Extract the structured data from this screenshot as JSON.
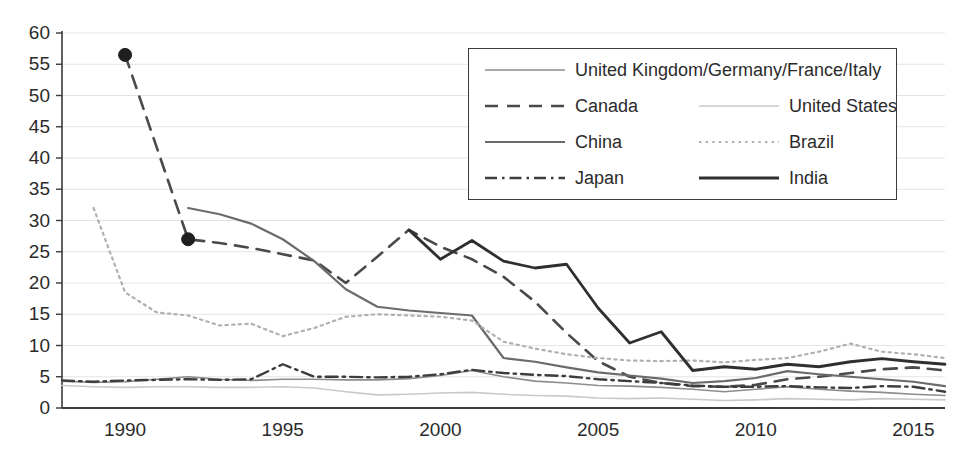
{
  "chart_data": {
    "type": "line",
    "title": "",
    "xlabel": "",
    "ylabel": "",
    "xlim": [
      1988,
      2016
    ],
    "ylim": [
      0,
      60
    ],
    "ytick_step": 5,
    "grid": "horizontal",
    "legend_position": "top-right",
    "xticks": [
      "1990",
      "1995",
      "2000",
      "2005",
      "2010",
      "2015"
    ],
    "xtick_values": [
      1990,
      1995,
      2000,
      2005,
      2010,
      2015
    ],
    "yticks": [
      "0",
      "5",
      "10",
      "15",
      "20",
      "25",
      "30",
      "35",
      "40",
      "45",
      "50",
      "55",
      "60"
    ],
    "ytick_values": [
      0,
      5,
      10,
      15,
      20,
      25,
      30,
      35,
      40,
      45,
      50,
      55,
      60
    ],
    "series": [
      {
        "name": "United Kingdom/Germany/France/Italy",
        "style": "solid-thin",
        "color": "#8c8c8c",
        "width": 1.6,
        "markers": false,
        "x": [
          1988,
          1989,
          1990,
          1991,
          1992,
          1993,
          1994,
          1995,
          1996,
          1997,
          1998,
          1999,
          2000,
          2001,
          2002,
          2003,
          2004,
          2005,
          2006,
          2007,
          2008,
          2009,
          2010,
          2011,
          2012,
          2013,
          2014,
          2015,
          2016
        ],
        "values": [
          4.3,
          4.1,
          4.2,
          4.6,
          5.0,
          4.6,
          4.4,
          4.6,
          4.6,
          4.5,
          4.5,
          4.7,
          5.2,
          6.0,
          5.0,
          4.3,
          4.0,
          3.6,
          3.5,
          3.3,
          3.0,
          2.6,
          3.0,
          3.4,
          3.0,
          2.7,
          2.5,
          2.2,
          2.0
        ]
      },
      {
        "name": "Canada",
        "style": "dashed",
        "color": "#4a4a4a",
        "width": 2.6,
        "markers": true,
        "marker_x": [
          1990,
          1992
        ],
        "marker_values": [
          56.5,
          27.0
        ],
        "x": [
          1990,
          1992,
          1993,
          1994,
          1995,
          1996,
          1997,
          1998,
          1999,
          2000,
          2001,
          2002,
          2003,
          2004,
          2005,
          2006,
          2007,
          2008,
          2009,
          2010,
          2011,
          2012,
          2013,
          2014,
          2015,
          2016
        ],
        "values": [
          56.5,
          27.0,
          26.4,
          25.6,
          24.6,
          23.6,
          20.0,
          24.2,
          28.5,
          25.8,
          23.8,
          21.0,
          17.0,
          12.0,
          7.5,
          5.0,
          4.0,
          3.5,
          3.4,
          3.7,
          4.6,
          5.0,
          5.6,
          6.2,
          6.5,
          6.0
        ]
      },
      {
        "name": "United States",
        "style": "solid-faint",
        "color": "#c9c9c9",
        "width": 1.6,
        "markers": false,
        "x": [
          1988,
          1989,
          1990,
          1991,
          1992,
          1993,
          1994,
          1995,
          1996,
          1997,
          1998,
          1999,
          2000,
          2001,
          2002,
          2003,
          2004,
          2005,
          2006,
          2007,
          2008,
          2009,
          2010,
          2011,
          2012,
          2013,
          2014,
          2015,
          2016
        ],
        "values": [
          3.6,
          3.4,
          3.3,
          3.4,
          3.4,
          3.3,
          3.3,
          3.4,
          3.2,
          2.6,
          2.1,
          2.2,
          2.4,
          2.5,
          2.2,
          2.0,
          1.9,
          1.6,
          1.5,
          1.6,
          1.4,
          1.2,
          1.3,
          1.5,
          1.4,
          1.3,
          1.5,
          1.4,
          1.3
        ]
      },
      {
        "name": "China",
        "style": "solid-medium",
        "color": "#6b6b6b",
        "width": 2.2,
        "markers": false,
        "x": [
          1992,
          1993,
          1994,
          1995,
          1996,
          1997,
          1998,
          1999,
          2000,
          2001,
          2002,
          2003,
          2004,
          2005,
          2006,
          2007,
          2008,
          2009,
          2010,
          2011,
          2012,
          2013,
          2014,
          2015,
          2016
        ],
        "values": [
          32.0,
          31.0,
          29.5,
          27.0,
          23.5,
          19.0,
          16.2,
          15.6,
          15.2,
          14.8,
          8.0,
          7.4,
          6.5,
          5.7,
          5.2,
          4.7,
          4.0,
          4.3,
          4.8,
          5.9,
          5.4,
          5.0,
          4.6,
          4.2,
          3.5
        ]
      },
      {
        "name": "Brazil",
        "style": "dotted",
        "color": "#b0b0b0",
        "width": 2.2,
        "markers": false,
        "x": [
          1989,
          1990,
          1991,
          1992,
          1993,
          1994,
          1995,
          1996,
          1997,
          1998,
          1999,
          2000,
          2001,
          2002,
          2003,
          2004,
          2005,
          2006,
          2007,
          2008,
          2009,
          2010,
          2011,
          2012,
          2013,
          2014,
          2015,
          2016
        ],
        "values": [
          32.0,
          18.5,
          15.3,
          14.8,
          13.2,
          13.5,
          11.5,
          12.8,
          14.6,
          15.0,
          14.8,
          14.6,
          14.0,
          10.6,
          9.5,
          8.6,
          8.0,
          7.6,
          7.5,
          7.6,
          7.3,
          7.7,
          8.0,
          9.0,
          10.3,
          9.0,
          8.6,
          8.0
        ]
      },
      {
        "name": "Japan",
        "style": "dash-dot",
        "color": "#3d3d3d",
        "width": 2.4,
        "markers": false,
        "x": [
          1988,
          1989,
          1990,
          1991,
          1992,
          1993,
          1994,
          1995,
          1996,
          1997,
          1998,
          1999,
          2000,
          2001,
          2002,
          2003,
          2004,
          2005,
          2006,
          2007,
          2008,
          2009,
          2010,
          2011,
          2012,
          2013,
          2014,
          2015,
          2016
        ],
        "values": [
          4.4,
          4.2,
          4.4,
          4.5,
          4.6,
          4.5,
          4.6,
          7.0,
          5.0,
          5.0,
          4.9,
          5.0,
          5.4,
          6.1,
          5.6,
          5.3,
          5.1,
          4.6,
          4.3,
          4.0,
          3.6,
          3.4,
          3.4,
          3.5,
          3.3,
          3.2,
          3.5,
          3.4,
          2.6
        ]
      },
      {
        "name": "India",
        "style": "solid-thick",
        "color": "#2f2f2f",
        "width": 2.8,
        "markers": false,
        "x": [
          1999,
          2000,
          2001,
          2002,
          2003,
          2004,
          2005,
          2006,
          2007,
          2008,
          2009,
          2010,
          2011,
          2012,
          2013,
          2014,
          2015,
          2016
        ],
        "values": [
          28.5,
          23.8,
          26.8,
          23.5,
          22.4,
          23.0,
          16.0,
          10.4,
          12.2,
          6.0,
          6.6,
          6.2,
          7.0,
          6.6,
          7.4,
          7.9,
          7.4,
          7.0
        ]
      }
    ]
  },
  "legend": {
    "rows": [
      [
        {
          "series": "United Kingdom/Germany/France/Italy",
          "style": "solid-thin",
          "color": "#8c8c8c"
        }
      ],
      [
        {
          "series": "Canada",
          "style": "dashed",
          "color": "#4a4a4a"
        },
        {
          "series": "United States",
          "style": "solid-faint",
          "color": "#c9c9c9"
        }
      ],
      [
        {
          "series": "China",
          "style": "solid-medium",
          "color": "#6b6b6b"
        },
        {
          "series": "Brazil",
          "style": "dotted",
          "color": "#b0b0b0"
        }
      ],
      [
        {
          "series": "Japan",
          "style": "dash-dot",
          "color": "#3d3d3d"
        },
        {
          "series": "India",
          "style": "solid-thick",
          "color": "#2f2f2f"
        }
      ]
    ],
    "labels": {
      "uk_germany_france_italy": "United Kingdom/Germany/France/Italy",
      "canada": "Canada",
      "united_states": "United States",
      "china": "China",
      "brazil": "Brazil",
      "japan": "Japan",
      "india": "India"
    }
  },
  "axes": {
    "axis_color": "#3a3a3a",
    "grid_color": "#e4e4e4",
    "tick_label_color": "#2b2b2b"
  }
}
